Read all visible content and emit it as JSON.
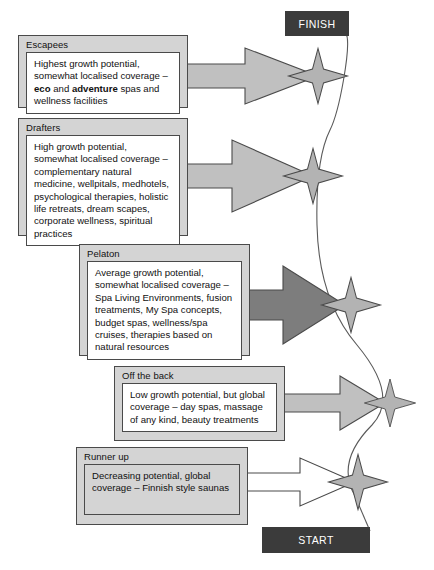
{
  "diagram": {
    "type": "race-metaphor-flow",
    "finish_label": "FINISH",
    "start_label": "START",
    "colors": {
      "card_fill": "#d4d4d4",
      "card_border": "#4a4a4a",
      "arrow_light": "#c0c0c0",
      "arrow_dark": "#7d7d7d",
      "arrow_white": "#ffffff",
      "star_fill": "#b3b3b3",
      "endchip_fill": "#3b3b3b",
      "text": "#111111"
    },
    "groups": [
      {
        "id": "escapees",
        "title": "Escapees",
        "body_plain": "Highest growth potential, somewhat localised coverage – eco and adventure spas and wellness facilities",
        "body_html": "Highest growth potential, somewhat localised coverage – <b>eco</b> and <b>adventure</b> spas and wellness facilities",
        "body_fill": "white",
        "arrow_style": "light",
        "growth": "Highest growth potential",
        "coverage": "somewhat localised coverage"
      },
      {
        "id": "drafters",
        "title": "Drafters",
        "body_plain": "High growth potential, somewhat localised coverage – complementary natural medicine, wellpitals, medhotels, psychological therapies, holistic life retreats, dream scapes, corporate wellness, spiritual practices",
        "body_html": "High growth potential, somewhat localised coverage – complementary natural medicine, wellpitals, medhotels, psychological therapies, holistic life retreats, dream scapes, corporate wellness, spiritual practices",
        "body_fill": "white",
        "arrow_style": "light",
        "growth": "High growth potential",
        "coverage": "somewhat localised coverage"
      },
      {
        "id": "pelaton",
        "title": "Pelaton",
        "body_plain": "Average growth potential, somewhat localised coverage – Spa Living Environments, fusion treatments, My Spa concepts, budget spas, wellness/spa cruises, therapies based on natural resources",
        "body_html": "Average growth potential, somewhat localised coverage – Spa Living Environments, fusion treatments, My Spa concepts, budget spas, wellness/spa cruises, therapies based on natural resources",
        "body_fill": "white",
        "arrow_style": "dark",
        "growth": "Average growth potential",
        "coverage": "somewhat localised coverage"
      },
      {
        "id": "off-the-back",
        "title": "Off the back",
        "body_plain": "Low growth potential, but global coverage – day spas, massage of any kind, beauty treatments",
        "body_html": "Low growth potential, but global coverage – day spas, massage of any kind, beauty treatments",
        "body_fill": "white",
        "arrow_style": "light",
        "growth": "Low growth potential",
        "coverage": "global coverage"
      },
      {
        "id": "runner-up",
        "title": "Runner up",
        "body_plain": "Decreasing potential, global coverage – Finnish style saunas",
        "body_html": "Decreasing potential, global coverage – Finnish style saunas",
        "body_fill": "gray",
        "arrow_style": "white",
        "growth": "Decreasing potential",
        "coverage": "global coverage"
      }
    ],
    "stars": [
      {
        "id": "star-escapees",
        "label": "position marker 1"
      },
      {
        "id": "star-drafters",
        "label": "position marker 2"
      },
      {
        "id": "star-pelaton",
        "label": "position marker 3"
      },
      {
        "id": "star-off-the-back",
        "label": "position marker 4"
      },
      {
        "id": "star-runner-up",
        "label": "position marker 5"
      }
    ]
  }
}
